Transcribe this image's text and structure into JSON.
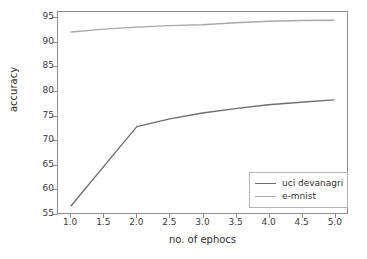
{
  "chart_data": {
    "type": "line",
    "title": "",
    "xlabel": "no. of ephocs",
    "ylabel": "accuracy",
    "xlim": [
      0.8,
      5.2
    ],
    "ylim": [
      55,
      96.2
    ],
    "grid": false,
    "legend_position": "lower right",
    "x": [
      1.0,
      1.5,
      2.0,
      2.5,
      3.0,
      3.5,
      4.0,
      4.5,
      5.0
    ],
    "xticks": [
      "1.0",
      "1.5",
      "2.0",
      "2.5",
      "3.0",
      "3.5",
      "4.0",
      "4.5",
      "5.0"
    ],
    "xtick_values": [
      1.0,
      1.5,
      2.0,
      2.5,
      3.0,
      3.5,
      4.0,
      4.5,
      5.0
    ],
    "yticks": [
      "55",
      "60",
      "65",
      "70",
      "75",
      "80",
      "85",
      "90",
      "95"
    ],
    "ytick_values": [
      55,
      60,
      65,
      70,
      75,
      80,
      85,
      90,
      95
    ],
    "series": [
      {
        "name": "uci devanagri",
        "color": "#6e6e6e",
        "values": [
          56.5,
          64.6,
          72.7,
          74.3,
          75.5,
          76.4,
          77.2,
          77.7,
          78.2
        ]
      },
      {
        "name": "e-mnist",
        "color": "#a8a8a8",
        "values": [
          92.1,
          92.7,
          93.1,
          93.4,
          93.6,
          94.0,
          94.3,
          94.45,
          94.5
        ]
      }
    ]
  },
  "legend": {
    "entries": [
      {
        "label": "uci devanagri"
      },
      {
        "label": "e-mnist"
      }
    ]
  },
  "colors": {
    "axis": "#8d8d8d",
    "text": "#2f2f2f",
    "background": "#ffffff"
  }
}
